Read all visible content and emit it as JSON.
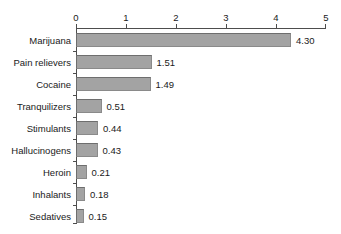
{
  "chart_data": {
    "type": "bar",
    "orientation": "horizontal",
    "title": "",
    "xlabel": "",
    "ylabel": "",
    "xlim": [
      0,
      5
    ],
    "xticks": [
      "0",
      "1",
      "2",
      "3",
      "4",
      "5"
    ],
    "grid": false,
    "legend": "none",
    "value_label_format": "2-decimal",
    "bar_color": "#a3a3a3",
    "bar_edge_color": "#6e6e6e",
    "axis_color": "#4d4d4d",
    "axis_position": "top",
    "categories": [
      "Marijuana",
      "Pain relievers",
      "Cocaine",
      "Tranquilizers",
      "Stimulants",
      "Hallucinogens",
      "Heroin",
      "Inhalants",
      "Sedatives"
    ],
    "values": [
      4.3,
      1.51,
      1.49,
      0.51,
      0.44,
      0.43,
      0.21,
      0.18,
      0.15
    ],
    "value_labels": [
      "4.30",
      "1.51",
      "1.49",
      "0.51",
      "0.44",
      "0.43",
      "0.21",
      "0.18",
      "0.15"
    ]
  }
}
